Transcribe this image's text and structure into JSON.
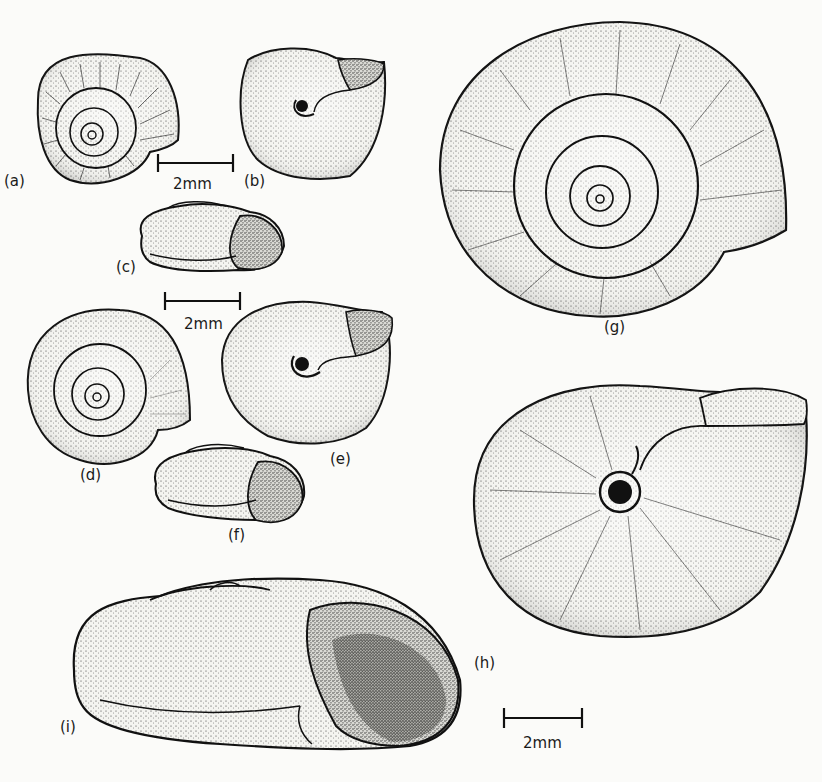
{
  "figure": {
    "type": "scientific-illustration",
    "ink_color": "#111111",
    "background_color": "#fbfbf9"
  },
  "specimens": [
    {
      "id": "a",
      "label": "(a)",
      "view": "apical (top) view, ribbed shell"
    },
    {
      "id": "b",
      "label": "(b)",
      "view": "umbilical (bottom) view"
    },
    {
      "id": "c",
      "label": "(c)",
      "view": "apertural side view"
    },
    {
      "id": "d",
      "label": "(d)",
      "view": "apical (top) view"
    },
    {
      "id": "e",
      "label": "(e)",
      "view": "umbilical (bottom) view"
    },
    {
      "id": "f",
      "label": "(f)",
      "view": "apertural side view"
    },
    {
      "id": "g",
      "label": "(g)",
      "view": "apical (top) view, large"
    },
    {
      "id": "h",
      "label": "(h)",
      "view": "umbilical (bottom) view, large"
    },
    {
      "id": "i",
      "label": "(i)",
      "view": "apertural side view, large"
    }
  ],
  "scale_bars": [
    {
      "id": "scale-1",
      "label": "2mm",
      "applies_to": "a, b, c"
    },
    {
      "id": "scale-2",
      "label": "2mm",
      "applies_to": "d, e, f"
    },
    {
      "id": "scale-3",
      "label": "2mm",
      "applies_to": "g, h, i"
    }
  ]
}
